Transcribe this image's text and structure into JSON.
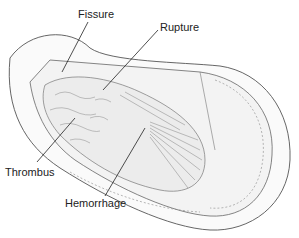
{
  "diagram": {
    "labels": [
      {
        "id": "fissure",
        "text": "Fissure",
        "x": 78,
        "y": 9
      },
      {
        "id": "rupture",
        "text": "Rupture",
        "x": 160,
        "y": 22
      },
      {
        "id": "thrombus",
        "text": "Thrombus",
        "x": 5,
        "y": 167
      },
      {
        "id": "hemorrhage",
        "text": "Hemorrhage",
        "x": 65,
        "y": 198
      }
    ]
  }
}
